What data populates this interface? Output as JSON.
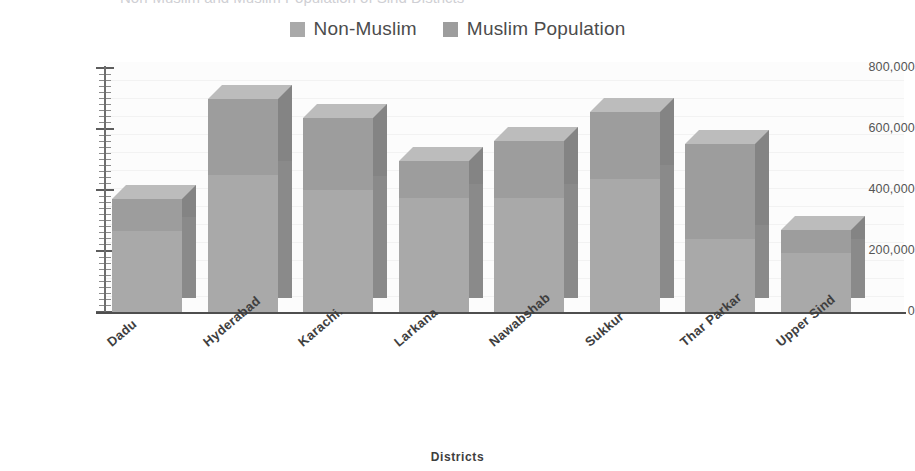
{
  "title_sliver": "Non-Muslim and Muslim Population of Sind Districts",
  "legend": {
    "position": "top-center",
    "items": [
      {
        "label": "Non-Muslim",
        "color": "#a9a9a9",
        "swatch_name": "legend-swatch-non-muslim"
      },
      {
        "label": "Muslim Population",
        "color": "#9d9d9d",
        "swatch_name": "legend-swatch-muslim"
      }
    ]
  },
  "axis": {
    "x_title": "Districts",
    "y_ticks": [
      "0",
      "200,000",
      "400,000",
      "600,000",
      "800,000"
    ]
  },
  "chart_data": {
    "type": "bar",
    "subtype": "stacked-column-3d",
    "title": "Non-Muslim and Muslim Population of Sind Districts",
    "xlabel": "Districts",
    "ylabel": "",
    "ylim": [
      0,
      800000
    ],
    "ytick_values": [
      0,
      200000,
      400000,
      600000,
      800000
    ],
    "ytick_labels": [
      "0",
      "200,000",
      "400,000",
      "600,000",
      "800,000"
    ],
    "minor_tick_interval": 20000,
    "grid": false,
    "legend_position": "top-center",
    "categories": [
      "Dadu",
      "Hyderabad",
      "Karachi.",
      "Larkana",
      "Nawabshab",
      "Sukkur",
      "Thar Parkar",
      "Upper Sind"
    ],
    "series": [
      {
        "name": "Muslim Population",
        "color": "#9d9d9d",
        "values": [
          265000,
          450000,
          400000,
          375000,
          375000,
          435000,
          240000,
          195000
        ]
      },
      {
        "name": "Non-Muslim",
        "color": "#a9a9a9",
        "values": [
          105000,
          250000,
          235000,
          120000,
          185000,
          220000,
          310000,
          75000
        ]
      }
    ],
    "totals": [
      370000,
      700000,
      635000,
      495000,
      560000,
      655000,
      550000,
      270000
    ]
  }
}
